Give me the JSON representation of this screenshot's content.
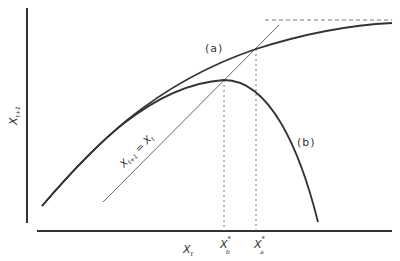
{
  "diagram": {
    "type": "cobweb-map",
    "axes": {
      "y_label": "X",
      "y_label_sub": "t+1",
      "x_label": "X",
      "x_label_sub": "t"
    },
    "curves": [
      {
        "id": "a",
        "label": "(a)",
        "description": "monotonically increasing, saturating curve"
      },
      {
        "id": "b",
        "label": "(b)",
        "description": "humped curve"
      }
    ],
    "identity_line": {
      "label_main1": "X",
      "label_sub1": "t+1",
      "label_eq": " = ",
      "label_main2": "X",
      "label_sub2": "t"
    },
    "equilibria": [
      {
        "symbol": "X",
        "sup": "*",
        "sub": "b"
      },
      {
        "symbol": "X",
        "sup": "*",
        "sub": "a"
      }
    ],
    "colors": {
      "line": "#333333",
      "identity": "#666666",
      "dashed": "#777777"
    }
  }
}
